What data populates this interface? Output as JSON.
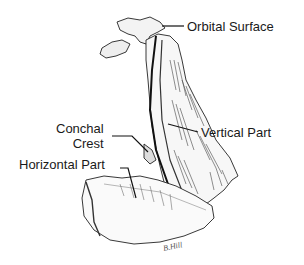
{
  "figure": {
    "labels": {
      "orbital_surface": "Orbital Surface",
      "vertical_part": "Vertical Part",
      "conchal_crest_line1": "Conchal",
      "conchal_crest_line2": "Crest",
      "horizontal_part": "Horizontal Part"
    },
    "signature": "B.Hill"
  }
}
